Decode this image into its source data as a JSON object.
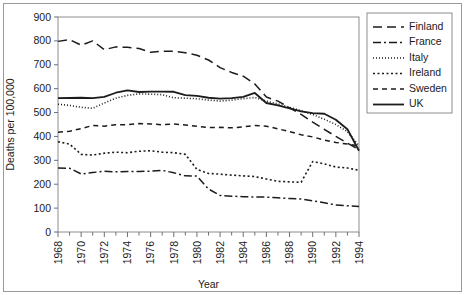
{
  "chart_data": {
    "type": "line",
    "title": "",
    "xlabel": "Year",
    "ylabel": "Deaths per 100,000",
    "xlim": [
      1968,
      1994
    ],
    "ylim": [
      0,
      900
    ],
    "grid": false,
    "legend_position": "right",
    "x": [
      1968,
      1969,
      1970,
      1971,
      1972,
      1973,
      1974,
      1975,
      1976,
      1977,
      1978,
      1979,
      1980,
      1981,
      1982,
      1983,
      1984,
      1985,
      1986,
      1987,
      1988,
      1989,
      1990,
      1991,
      1992,
      1993,
      1994
    ],
    "xticks": [
      1968,
      1970,
      1972,
      1974,
      1976,
      1978,
      1980,
      1982,
      1984,
      1986,
      1988,
      1990,
      1992,
      1994
    ],
    "xtick_labels": [
      "1968",
      "1970",
      "1972",
      "1974",
      "1976",
      "1978",
      "1980",
      "1982",
      "1984",
      "1986",
      "1988",
      "1990",
      "1992",
      "1994"
    ],
    "yticks": [
      0,
      100,
      200,
      300,
      400,
      500,
      600,
      700,
      800,
      900
    ],
    "ytick_labels": [
      "0",
      "100",
      "200",
      "300",
      "400",
      "500",
      "600",
      "700",
      "800",
      "900"
    ],
    "series": [
      {
        "name": "Finland",
        "dash": "9,5",
        "width": 1.5,
        "values": [
          798,
          805,
          782,
          800,
          763,
          775,
          773,
          768,
          752,
          757,
          757,
          750,
          740,
          720,
          688,
          668,
          652,
          620,
          565,
          548,
          520,
          492,
          460,
          430,
          400,
          372,
          345
        ]
      },
      {
        "name": "France",
        "dash": "8,3,2,3",
        "width": 1.5,
        "values": [
          268,
          267,
          243,
          249,
          254,
          252,
          253,
          253,
          255,
          258,
          248,
          235,
          234,
          180,
          153,
          150,
          148,
          146,
          146,
          143,
          140,
          138,
          131,
          122,
          113,
          110,
          107
        ]
      },
      {
        "name": "Italy",
        "dash": "1,2",
        "width": 1.6,
        "values": [
          535,
          530,
          522,
          518,
          540,
          560,
          572,
          578,
          577,
          575,
          562,
          560,
          558,
          552,
          548,
          552,
          558,
          563,
          548,
          536,
          522,
          508,
          492,
          472,
          450,
          420,
          360
        ]
      },
      {
        "name": "Ireland",
        "dash": "2,2.5",
        "width": 1.6,
        "values": [
          378,
          368,
          325,
          322,
          330,
          334,
          332,
          338,
          340,
          334,
          332,
          325,
          262,
          245,
          242,
          238,
          235,
          232,
          222,
          212,
          210,
          208,
          295,
          285,
          272,
          268,
          258
        ]
      },
      {
        "name": "Sweden",
        "dash": "5,4",
        "width": 1.5,
        "values": [
          418,
          422,
          433,
          446,
          443,
          449,
          449,
          454,
          452,
          449,
          452,
          448,
          443,
          437,
          438,
          436,
          440,
          446,
          443,
          432,
          420,
          407,
          398,
          385,
          375,
          368,
          360
        ]
      },
      {
        "name": "UK",
        "dash": "0",
        "width": 1.8,
        "values": [
          560,
          561,
          562,
          560,
          566,
          583,
          593,
          586,
          588,
          588,
          587,
          573,
          570,
          562,
          558,
          560,
          566,
          582,
          540,
          530,
          518,
          505,
          498,
          495,
          470,
          430,
          340
        ]
      }
    ]
  },
  "legend": {
    "items": [
      {
        "label": "Finland"
      },
      {
        "label": "France"
      },
      {
        "label": "Italy"
      },
      {
        "label": "Ireland"
      },
      {
        "label": "Sweden"
      },
      {
        "label": "UK"
      }
    ]
  }
}
